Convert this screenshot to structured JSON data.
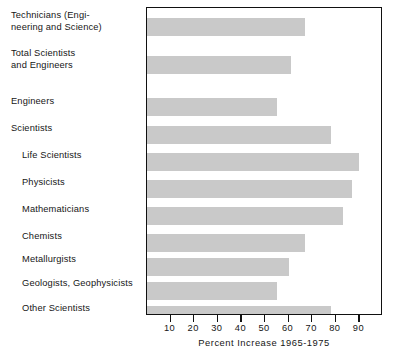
{
  "chart_data": {
    "type": "bar",
    "orientation": "horizontal",
    "title": "",
    "xlabel": "Percent Increase 1965-1975",
    "ylabel": "",
    "xlim": [
      0,
      100
    ],
    "xticks": [
      10,
      20,
      30,
      40,
      50,
      60,
      70,
      80,
      90
    ],
    "xtick_labels": [
      "10",
      "20",
      "30",
      "40",
      "50",
      "60",
      "70",
      "80",
      "90"
    ],
    "grid": false,
    "legend": null,
    "bar_color": "#c9c9c9",
    "frame_color": "#111111",
    "categories": [
      "Technicians (Engi-\nneering and Science)",
      "Total Scientists\nand Engineers",
      "Engineers",
      "Scientists",
      "Life Scientists",
      "Physicists",
      "Mathematicians",
      "Chemists",
      "Metallurgists",
      "Geologists, Geophysicists",
      "Other Scientists"
    ],
    "values": [
      67,
      61,
      55,
      78,
      90,
      87,
      83,
      67,
      60,
      55,
      78
    ],
    "bars": [
      {
        "label": "Technicians (Engi-\nneering and Science)",
        "value": 67,
        "indent": false
      },
      {
        "label": "Total Scientists\nand Engineers",
        "value": 61,
        "indent": false
      },
      {
        "label": "Engineers",
        "value": 55,
        "indent": false
      },
      {
        "label": "Scientists",
        "value": 78,
        "indent": false
      },
      {
        "label": "Life Scientists",
        "value": 90,
        "indent": true
      },
      {
        "label": "Physicists",
        "value": 87,
        "indent": true
      },
      {
        "label": "Mathematicians",
        "value": 83,
        "indent": true
      },
      {
        "label": "Chemists",
        "value": 67,
        "indent": true
      },
      {
        "label": "Metallurgists",
        "value": 60,
        "indent": true
      },
      {
        "label": "Geologists, Geophysicists",
        "value": 55,
        "indent": true
      },
      {
        "label": "Other Scientists",
        "value": 78,
        "indent": true
      }
    ]
  },
  "labels": {
    "technicians": "Technicians (Engi-\nneering and Science)",
    "total_scientists": "Total Scientists\nand Engineers",
    "engineers": "Engineers",
    "scientists": "Scientists",
    "life_scientists": "Life Scientists",
    "physicists": "Physicists",
    "mathematicians": "Mathematicians",
    "chemists": "Chemists",
    "metallurgists": "Metallurgists",
    "geologists": "Geologists, Geophysicists",
    "other_scientists": "Other Scientists"
  },
  "axis": {
    "title": "Percent Increase 1965-1975",
    "ticks": [
      "10",
      "20",
      "30",
      "40",
      "50",
      "60",
      "70",
      "80",
      "90"
    ]
  }
}
